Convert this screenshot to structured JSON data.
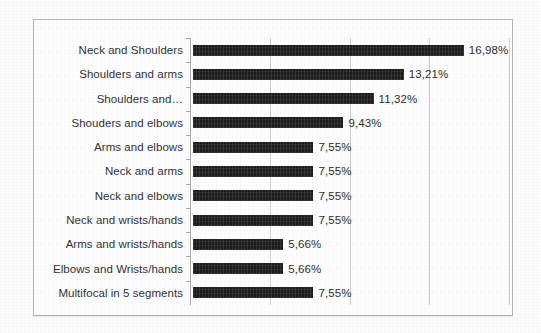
{
  "figure": {
    "frame_border_color": "#b9b9b9",
    "bar_color": "#1c1c1c",
    "label_color": "#333333",
    "gridline_color": "#cfcfcf"
  },
  "chart_data": {
    "type": "bar",
    "orientation": "horizontal",
    "title": "",
    "subtitle": "",
    "xlabel": "",
    "ylabel": "",
    "xlim": [
      0,
      20
    ],
    "grid": "vertical",
    "legend": "none",
    "value_suffix": "%",
    "decimal_separator": ",",
    "gridline_values": [
      5,
      10,
      15,
      20
    ],
    "categories": [
      "Neck and Shoulders",
      "Shoulders and arms",
      "Shoulders and…",
      "Shouders and elbows",
      "Arms and elbows",
      "Neck and arms",
      "Neck and elbows",
      "Neck and wrists/hands",
      "Arms and wrists/hands",
      "Elbows and Wrists/hands",
      "Multifocal in 5 segments"
    ],
    "values": [
      16.98,
      13.21,
      11.32,
      9.43,
      7.55,
      7.55,
      7.55,
      7.55,
      5.66,
      5.66,
      7.55
    ],
    "data_labels": [
      "16,98%",
      "13,21%",
      "11,32%",
      "9,43%",
      "7,55%",
      "7,55%",
      "7,55%",
      "7,55%",
      "5,66%",
      "5,66%",
      "7,55%"
    ]
  }
}
